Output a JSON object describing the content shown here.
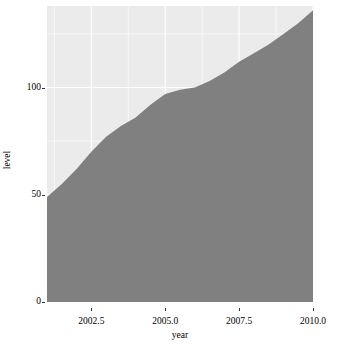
{
  "chart_data": {
    "type": "area",
    "title": "",
    "xlabel": "year",
    "ylabel": "level",
    "xlim": [
      2001.0,
      2010.0
    ],
    "ylim": [
      0,
      138
    ],
    "grid": true,
    "legend": "none",
    "fill_color": "#808080",
    "panel_background": "#ebebeb",
    "gridline_color": "#ffffff",
    "x": [
      2001.0,
      2001.5,
      2002.0,
      2002.5,
      2003.0,
      2003.5,
      2004.0,
      2004.5,
      2005.0,
      2005.5,
      2006.0,
      2006.5,
      2007.0,
      2007.5,
      2008.0,
      2008.5,
      2009.0,
      2009.5,
      2010.0
    ],
    "values": [
      49,
      55,
      62,
      70,
      77,
      82,
      86,
      92,
      97,
      99,
      100,
      103,
      107,
      112,
      116,
      120,
      125,
      130,
      136
    ],
    "x_ticks": [
      2002.5,
      2005.0,
      2007.5,
      2010.0
    ],
    "x_tick_labels": [
      "2002.5",
      "2005.0",
      "2007.5",
      "2010.0"
    ],
    "y_ticks": [
      0,
      50,
      100
    ],
    "y_tick_labels": [
      "0",
      "50",
      "100"
    ]
  },
  "axes": {
    "x_title": "year",
    "y_title": "level"
  }
}
